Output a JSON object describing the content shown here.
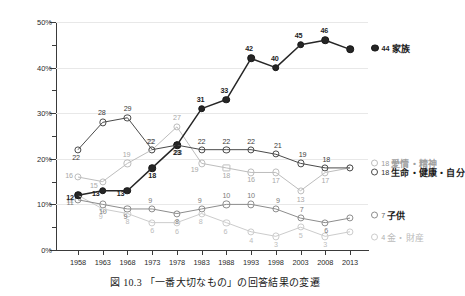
{
  "caption": "図 10.3 「一番大切なもの」の回答結果の変遷",
  "axes": {
    "y_ticks": [
      "50%",
      "40%",
      "30%",
      "20%",
      "10%",
      "0%"
    ],
    "x_ticks": [
      "1958",
      "1963",
      "1968",
      "1973",
      "1978",
      "1983",
      "1988",
      "1993",
      "1998",
      "2003",
      "2008",
      "2013"
    ]
  },
  "legend": {
    "family": {
      "value": "44",
      "label": "家族"
    },
    "affection": {
      "value": "18",
      "label": "愛情・精神"
    },
    "life": {
      "value": "18",
      "label": "生命・健康・自分"
    },
    "children": {
      "value": "7",
      "label": "子供"
    },
    "money": {
      "value": "4",
      "label": "金・財産"
    }
  },
  "chart_data": {
    "type": "line",
    "title": "図 10.3 「一番大切なもの」の回答結果の変遷",
    "xlabel": "",
    "ylabel": "",
    "ylim": [
      0,
      50
    ],
    "ytick_step": 10,
    "yminor_step": 5,
    "grid": true,
    "legend_position": "right-inline",
    "categories": [
      "1958",
      "1963",
      "1968",
      "1973",
      "1978",
      "1983",
      "1988",
      "1993",
      "1998",
      "2003",
      "2008",
      "2013"
    ],
    "series": [
      {
        "name": "家族",
        "color": "#262626",
        "marker": "filled-circle",
        "values": [
          12,
          13,
          13,
          18,
          23,
          31,
          33,
          42,
          40,
          45,
          46,
          44
        ]
      },
      {
        "name": "生命・健康・自分",
        "color": "#4a4a4a",
        "marker": "open-circle",
        "values": [
          22,
          28,
          29,
          22,
          23,
          22,
          22,
          22,
          21,
          19,
          18,
          18
        ]
      },
      {
        "name": "愛情・精神",
        "color": "#bdbdbd",
        "marker": "open-circle",
        "values": [
          16,
          15,
          19,
          22,
          27,
          19,
          18,
          17,
          17,
          13,
          17,
          18
        ]
      },
      {
        "name": "子供",
        "color": "#8d8d8d",
        "marker": "open-circle",
        "values": [
          11,
          10,
          9,
          9,
          8,
          9,
          10,
          10,
          9,
          7,
          6,
          7
        ]
      },
      {
        "name": "金・財産",
        "color": "#cccccc",
        "marker": "open-circle",
        "values": [
          12,
          9,
          8,
          6,
          6,
          8,
          6,
          4,
          3,
          5,
          3,
          4
        ]
      }
    ]
  },
  "point_labels": {
    "family": [
      "12",
      "13",
      "13",
      "18",
      "23",
      "31",
      "33",
      "42",
      "40",
      "45",
      "46",
      "44"
    ],
    "life": [
      "22",
      "28",
      "29",
      "22",
      "23",
      "22",
      "22",
      "22",
      "21",
      "19",
      "18",
      "18"
    ],
    "affection": [
      "16",
      "15",
      "19",
      "22",
      "27",
      "19",
      "18",
      "16",
      "17",
      "13",
      "17",
      "18"
    ],
    "children": [
      "11",
      "10",
      "9",
      "9",
      "8",
      "9",
      "10",
      "10",
      "9",
      "7",
      "6",
      "7"
    ],
    "money": [
      "12",
      "9",
      "8",
      "6",
      "6",
      "8",
      "6",
      "4",
      "3",
      "5",
      "3",
      "4"
    ]
  }
}
